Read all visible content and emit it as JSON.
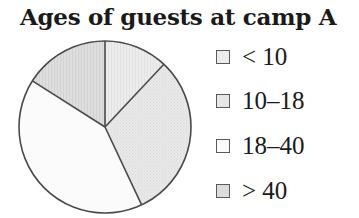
{
  "chart_data": {
    "type": "pie",
    "title": "Ages of guests at camp A",
    "categories": [
      "< 10",
      "10–18",
      "18–40",
      "> 40"
    ],
    "values": [
      12,
      31,
      41,
      16
    ],
    "unit": "percent (estimated from slice angles)",
    "start_angle_deg": 0,
    "direction": "clockwise",
    "legend_position": "right",
    "colors": [
      "#ececec",
      "#e6e6e6",
      "#fbfbfb",
      "#dcdcdc"
    ],
    "xlabel": "",
    "ylabel": ""
  },
  "legend": {
    "items": [
      {
        "label": "< 10",
        "swatch": "#ececec"
      },
      {
        "label": "10–18",
        "swatch": "#e6e6e6"
      },
      {
        "label": "18–40",
        "swatch": "#fbfbfb"
      },
      {
        "label": "> 40",
        "swatch": "#dcdcdc"
      }
    ]
  },
  "style": {
    "outline_color": "#4a4a4a"
  }
}
